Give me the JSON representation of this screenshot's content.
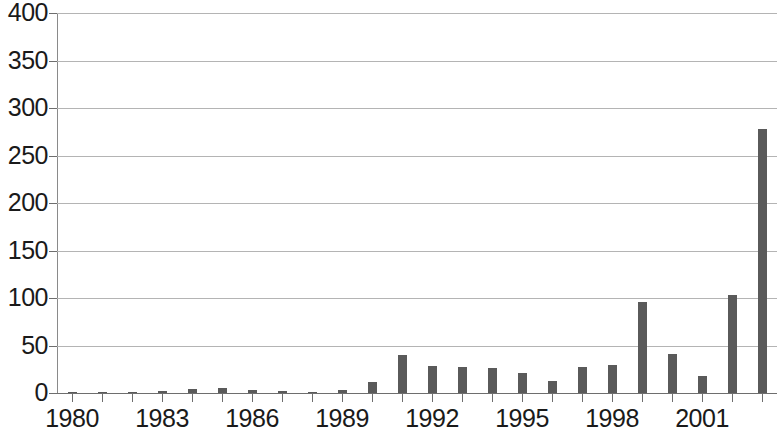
{
  "chart_data": {
    "type": "bar",
    "title": "",
    "subtitle": "",
    "xlabel": "",
    "ylabel": "",
    "xlim": [
      1979.5,
      2003.5
    ],
    "ylim": [
      0,
      400
    ],
    "grid": true,
    "legend": null,
    "bar_color": "#5a5a5a",
    "gridline_color": "#b4b4b4",
    "axis_color": "#6e6e6e",
    "text_color": "#1a1a1a",
    "y_ticks": [
      0,
      50,
      100,
      150,
      200,
      250,
      300,
      350,
      400
    ],
    "y_tick_labels": [
      "0",
      "50",
      "100",
      "150",
      "200",
      "250",
      "300",
      "350",
      "400"
    ],
    "x_tick_labels_shown": [
      "1980",
      "1983",
      "1986",
      "1989",
      "1992",
      "1995",
      "1998",
      "2001"
    ],
    "categories": [
      "1980",
      "1981",
      "1982",
      "1983",
      "1984",
      "1985",
      "1986",
      "1987",
      "1988",
      "1989",
      "1990",
      "1991",
      "1992",
      "1993",
      "1994",
      "1995",
      "1996",
      "1997",
      "1998",
      "1999",
      "2000",
      "2001",
      "2002",
      "2003"
    ],
    "values": [
      1,
      1,
      1,
      2,
      4,
      5,
      3,
      2,
      1,
      3,
      12,
      40,
      28,
      27,
      26,
      21,
      13,
      27,
      30,
      96,
      41,
      18,
      103,
      278
    ],
    "values_note": "bar heights read off the 0-400 axis",
    "series": [
      {
        "name": "count",
        "values": [
          1,
          1,
          1,
          2,
          4,
          5,
          3,
          2,
          1,
          3,
          12,
          40,
          28,
          27,
          26,
          21,
          13,
          27,
          30,
          96,
          41,
          18,
          103,
          278
        ]
      }
    ]
  },
  "axis": {
    "y_labels": [
      "400",
      "350",
      "300",
      "250",
      "200",
      "150",
      "100",
      "50",
      "0"
    ],
    "x_labels": [
      "1980",
      "1983",
      "1986",
      "1989",
      "1992",
      "1995",
      "1998",
      "2001"
    ]
  }
}
